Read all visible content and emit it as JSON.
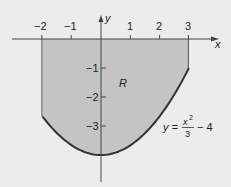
{
  "figure": {
    "region_label": "R",
    "axis_x_label": "x",
    "axis_y_label": "y",
    "x_ticks": [
      {
        "value": -2,
        "label": "−2"
      },
      {
        "value": -1,
        "label": "−1"
      },
      {
        "value": 1,
        "label": "1"
      },
      {
        "value": 2,
        "label": "2"
      },
      {
        "value": 3,
        "label": "3"
      }
    ],
    "y_ticks": [
      {
        "value": -1,
        "label": "−1"
      },
      {
        "value": -2,
        "label": "−2"
      },
      {
        "value": -3,
        "label": "−3"
      }
    ],
    "equation": {
      "lhs": "y =",
      "numerator": "x",
      "exponent": "2",
      "denominator": "3",
      "tail": "− 4"
    },
    "curve": "y = x^2/3 - 4",
    "region_bounds": {
      "x_min": -2,
      "x_max": 3,
      "y_top": 0
    },
    "colors": {
      "fill": "#c4c4c4",
      "curve": "#333333",
      "axis": "#444444",
      "background": "#ececec"
    }
  }
}
